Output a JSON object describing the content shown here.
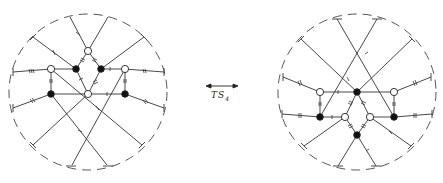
{
  "figure": {
    "transform_label": "TS",
    "transform_subscript": "4",
    "arrow": "double-headed",
    "colors": {
      "stroke": "#333333",
      "filled_node": "#111111",
      "open_node": "#ffffff",
      "boundary": "#444444"
    }
  },
  "left_diagram": {
    "boundary": {
      "cx": 88,
      "cy": 92,
      "rx": 79,
      "ry": 78,
      "style": "dashed"
    },
    "nodes": [
      {
        "id": "top",
        "x": 88,
        "y": 51,
        "type": "open"
      },
      {
        "id": "bl",
        "x": 76,
        "y": 69,
        "type": "filled"
      },
      {
        "id": "br",
        "x": 101,
        "y": 69,
        "type": "filled"
      },
      {
        "id": "ol",
        "x": 51,
        "y": 69,
        "type": "open"
      },
      {
        "id": "or",
        "x": 125,
        "y": 69,
        "type": "open"
      },
      {
        "id": "ob",
        "x": 88,
        "y": 94,
        "type": "open"
      },
      {
        "id": "fl",
        "x": 51,
        "y": 94,
        "type": "filled"
      },
      {
        "id": "fr",
        "x": 125,
        "y": 94,
        "type": "filled"
      }
    ]
  },
  "right_diagram": {
    "boundary": {
      "cx": 357,
      "cy": 92,
      "rx": 79,
      "ry": 78,
      "style": "dashed"
    },
    "nodes": [
      {
        "id": "ft",
        "x": 357,
        "y": 92,
        "type": "filled"
      },
      {
        "id": "oul",
        "x": 320,
        "y": 92,
        "type": "open"
      },
      {
        "id": "our",
        "x": 394,
        "y": 92,
        "type": "open"
      },
      {
        "id": "fll",
        "x": 320,
        "y": 117,
        "type": "filled"
      },
      {
        "id": "flr",
        "x": 394,
        "y": 117,
        "type": "filled"
      },
      {
        "id": "oml",
        "x": 345,
        "y": 117,
        "type": "open"
      },
      {
        "id": "omr",
        "x": 370,
        "y": 117,
        "type": "open"
      },
      {
        "id": "fb",
        "x": 357,
        "y": 135,
        "type": "filled"
      }
    ]
  }
}
